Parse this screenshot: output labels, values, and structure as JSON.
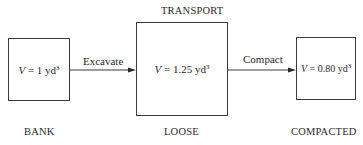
{
  "diagram": {
    "states": [
      {
        "id": "bank",
        "name": "BANK",
        "volume_var": "V",
        "volume_value": "1",
        "unit": "yd",
        "exponent": "3"
      },
      {
        "id": "loose",
        "name": "LOOSE",
        "volume_var": "V",
        "volume_value": "1.25",
        "unit": "yd",
        "exponent": "3"
      },
      {
        "id": "compacted",
        "name": "COMPACTED",
        "volume_var": "V",
        "volume_value": "0.80",
        "unit": "yd",
        "exponent": "3"
      }
    ],
    "transitions": [
      {
        "from": "bank",
        "to": "loose",
        "label": "Excavate"
      },
      {
        "from": "loose",
        "to": "compacted",
        "label": "Compact"
      }
    ],
    "phase_label": "TRANSPORT",
    "equals": " = ",
    "colors": {
      "line": "#3a3a3a",
      "text": "#2a2a2a",
      "background": "#ffffff"
    }
  }
}
